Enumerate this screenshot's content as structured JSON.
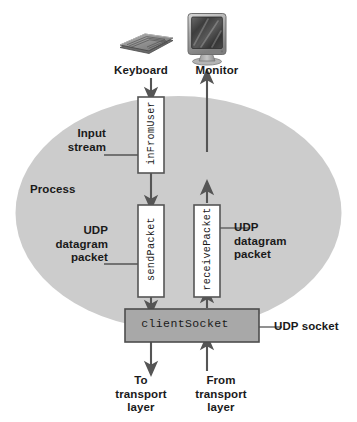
{
  "figure": {
    "colors": {
      "page_background": "#ffffff",
      "process_ellipse_fill": "#cccccc",
      "stream_box_fill": "#ffffff",
      "stream_box_stroke": "#555555",
      "socket_box_fill": "#a8a8a8",
      "socket_box_stroke": "#4d4d4d",
      "arrow": "#555555",
      "leader_line": "#555555",
      "text": "#1a1a1a",
      "device_dark": "#3a3a3a",
      "device_mid": "#8c8c8c",
      "device_light": "#c9c9c9"
    }
  },
  "devices": {
    "keyboard": {
      "label": "Keyboard",
      "icon": "keyboard-icon"
    },
    "monitor": {
      "label": "Monitor",
      "icon": "monitor-icon"
    }
  },
  "process": {
    "label": "Process",
    "shape": "ellipse"
  },
  "boxes": [
    {
      "id": "in-from-user",
      "code_label": "inFromUser",
      "orientation": "vertical",
      "callout": "Input\nstream",
      "callout_side": "left"
    },
    {
      "id": "send-packet",
      "code_label": "sendPacket",
      "orientation": "vertical",
      "callout": "UDP\ndatagram\npacket",
      "callout_side": "left"
    },
    {
      "id": "receive-packet",
      "code_label": "receivePacket",
      "orientation": "vertical",
      "callout": "UDP\ndatagram\npacket",
      "callout_side": "right"
    },
    {
      "id": "client-socket",
      "code_label": "clientSocket",
      "orientation": "horizontal",
      "callout": "UDP socket",
      "callout_side": "right"
    }
  ],
  "callouts": {
    "input_stream": "Input\nstream",
    "udp_datagram_packet_left": "UDP\ndatagram\npacket",
    "udp_datagram_packet_right": "UDP\ndatagram\npacket",
    "udp_socket": "UDP socket"
  },
  "transport": {
    "to_transport_layer": "To\ntransport\nlayer",
    "from_transport_layer": "From\ntransport\nlayer"
  },
  "flows": [
    {
      "name": "keyboard-to-instream",
      "from": "Keyboard",
      "to": "inFromUser",
      "direction": "down"
    },
    {
      "name": "instream-to-sendpacket",
      "from": "inFromUser",
      "to": "sendPacket",
      "direction": "down"
    },
    {
      "name": "sendpacket-to-socket",
      "from": "sendPacket",
      "to": "clientSocket",
      "direction": "down"
    },
    {
      "name": "socket-to-transport",
      "from": "clientSocket",
      "to": "transport layer",
      "direction": "down"
    },
    {
      "name": "transport-to-socket",
      "from": "transport layer",
      "to": "clientSocket",
      "direction": "up"
    },
    {
      "name": "socket-to-receivepacket",
      "from": "clientSocket",
      "to": "receivePacket",
      "direction": "up"
    },
    {
      "name": "receivepacket-to-monitor",
      "from": "receivePacket",
      "to": "Monitor",
      "direction": "up"
    }
  ]
}
